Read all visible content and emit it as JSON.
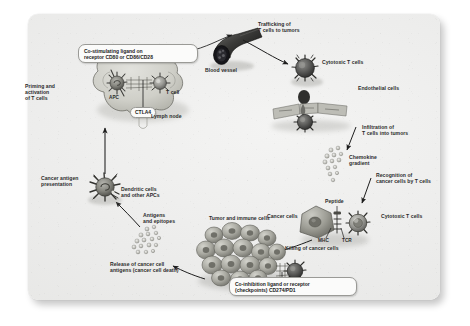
{
  "figure": {
    "panel_bg": "#ececeb",
    "ink": "#2b2b2b"
  },
  "callouts": [
    {
      "id": "co-stimulating",
      "text": "Co-stimulating ligand on\nreceptor CD80 or CD86/CD28"
    },
    {
      "id": "co-inhibition",
      "text": "Co-inhibition ligand or receptor\n(checkpoints) CD274/PD1"
    }
  ],
  "tags": [
    {
      "id": "ctla4",
      "text": "CTLA4"
    }
  ],
  "labels": [
    {
      "id": "priming-activation",
      "text": "Priming and\nactivation\nof T cells"
    },
    {
      "id": "apc",
      "text": "APC"
    },
    {
      "id": "t-cell",
      "text": "T cell"
    },
    {
      "id": "lymph-node",
      "text": "Lymph node"
    },
    {
      "id": "blood-vessel",
      "text": "Blood vessel"
    },
    {
      "id": "trafficking",
      "text": "Trafficking of\nT cells to tumors"
    },
    {
      "id": "cytotoxic-t-cells-top",
      "text": "Cytotoxic T cells"
    },
    {
      "id": "endothelial-cells",
      "text": "Endothelial cells"
    },
    {
      "id": "infiltration",
      "text": "Infiltration of\nT cells into tumors"
    },
    {
      "id": "chemokine-gradient",
      "text": "Chemokine\ngradient"
    },
    {
      "id": "recognition",
      "text": "Recognition of\ncancer cells by T cells"
    },
    {
      "id": "peptide",
      "text": "Peptide"
    },
    {
      "id": "cancer-cells",
      "text": "Cancer cells"
    },
    {
      "id": "mhc",
      "text": "MHC"
    },
    {
      "id": "tcr",
      "text": "TCR"
    },
    {
      "id": "cytotoxic-t-cells-right",
      "text": "Cytotoxic T cells"
    },
    {
      "id": "killing",
      "text": "Killing of cancer cells"
    },
    {
      "id": "tumor-immune-cells",
      "text": "Tumor and immune cells"
    },
    {
      "id": "release-antigens",
      "text": "Release of cancer cell\nantigens (cancer cell death)"
    },
    {
      "id": "antigens-epitopes",
      "text": "Antigens\nand epitopes"
    },
    {
      "id": "dendritic-cells",
      "text": "Dendritic cells\nand other APCs"
    },
    {
      "id": "cancer-antigen-presentation",
      "text": "Cancer antigen\npresentation"
    }
  ]
}
